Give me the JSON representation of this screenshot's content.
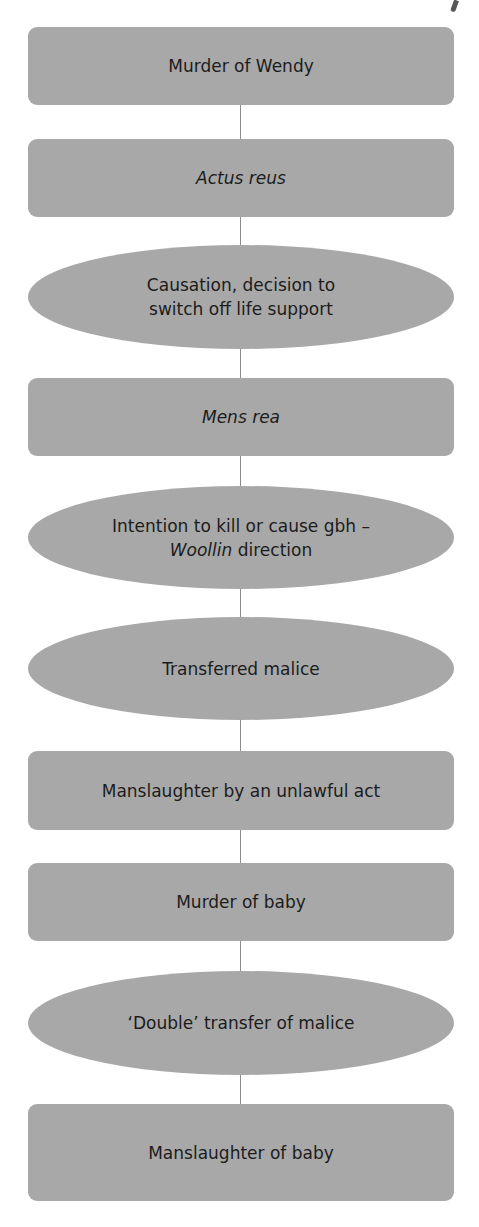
{
  "diagram": {
    "type": "vertical-flowchart",
    "colors": {
      "node_fill": "#a8a8a8",
      "connector": "#8c8c8c",
      "text": "#1c1c1c",
      "background": "#ffffff"
    },
    "nodes": [
      {
        "shape": "box",
        "label": "Murder of Wendy"
      },
      {
        "shape": "box",
        "label": "Actus reus",
        "italic": true
      },
      {
        "shape": "ellipse",
        "line1": "Causation, decision to",
        "line2": "switch off life support"
      },
      {
        "shape": "box",
        "label": "Mens rea",
        "italic": true
      },
      {
        "shape": "ellipse",
        "line1": "Intention to kill or cause gbh –",
        "line2_italic": "Woollin",
        "line2_rest": " direction"
      },
      {
        "shape": "ellipse",
        "label": "Transferred malice"
      },
      {
        "shape": "box",
        "label": "Manslaughter by an unlawful act"
      },
      {
        "shape": "box",
        "label": "Murder of baby"
      },
      {
        "shape": "ellipse",
        "label": "‘Double’ transfer of malice"
      },
      {
        "shape": "box",
        "label": "Manslaughter of baby"
      }
    ]
  }
}
